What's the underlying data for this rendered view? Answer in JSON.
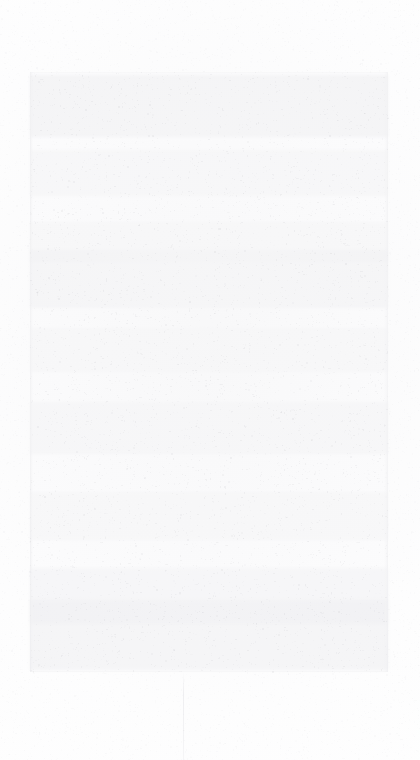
{
  "document": {
    "kind": "faded-scanned-page",
    "legible_text": "",
    "legibility_note": "No legible text, glyphs, icons or UI chrome are recoverable at any magnification.",
    "page_width": 420,
    "page_height": 760,
    "background_color": "#ffffff",
    "surface_color": "#fefefe"
  },
  "content_panel": {
    "label": "printed-content-area",
    "color": "#fcfcfd",
    "border_color": "#e4e4e7",
    "x": 30,
    "y": 72,
    "width": 358,
    "height": 600
  },
  "text_bands": [
    {
      "label": "band-upper",
      "y": 3,
      "height": 62,
      "opacity": 0.55
    },
    {
      "label": "band-upper-mid",
      "y": 78,
      "height": 46,
      "opacity": 0.34
    },
    {
      "label": "band-mid",
      "y": 150,
      "height": 40,
      "opacity": 0.3
    },
    {
      "label": "band-mid-dense",
      "y": 178,
      "height": 58,
      "opacity": 0.5
    },
    {
      "label": "band-center",
      "y": 256,
      "height": 44,
      "opacity": 0.32
    },
    {
      "label": "band-lower-mid",
      "y": 330,
      "height": 52,
      "opacity": 0.38
    },
    {
      "label": "band-lower",
      "y": 420,
      "height": 48,
      "opacity": 0.3
    },
    {
      "label": "band-lower-dense",
      "y": 496,
      "height": 56,
      "opacity": 0.42
    },
    {
      "label": "band-foot",
      "y": 528,
      "height": 70,
      "opacity": 0.52
    }
  ],
  "fold_seam": {
    "label": "vertical-fold-seam",
    "x": 183,
    "y": 672,
    "height": 88,
    "color": "#d8d8dd"
  },
  "margins": {
    "top": 72,
    "bottom": 88,
    "left": 30,
    "right": 32
  },
  "grain": {
    "label": "paper-grain-speckle",
    "seed": 20240517,
    "density": 2600,
    "min_alpha": 0.03,
    "max_alpha": 0.17,
    "color": "#8a8a93"
  }
}
